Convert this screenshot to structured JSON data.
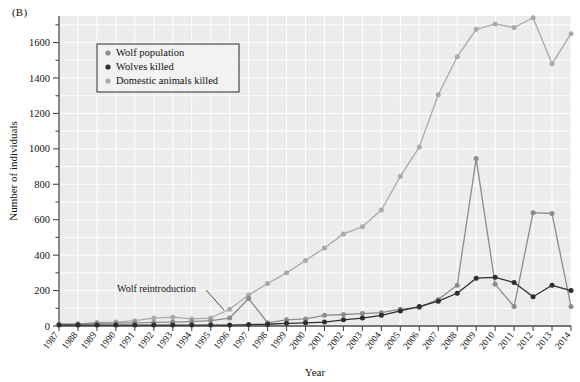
{
  "figure": {
    "panel_label": "(B)",
    "xlabel": "Year",
    "ylabel": "Number of individuals"
  },
  "annotation": {
    "text": "Wolf reintroduction",
    "anchor_year": "1996"
  },
  "legend": {
    "entries": [
      {
        "label": "Wolf population",
        "color": "#8c8c8c",
        "marker": "circle"
      },
      {
        "label": "Wolves killed",
        "color": "#2e2e2e",
        "marker": "circle"
      },
      {
        "label": "Domestic animals killed",
        "color": "#aaaaaa",
        "marker": "circle"
      }
    ]
  },
  "chart_data": {
    "type": "line",
    "title": "",
    "xlabel": "Year",
    "ylabel": "Number of individuals",
    "xlim": [
      1987,
      2014
    ],
    "ylim": [
      0,
      1750
    ],
    "ytick_step": 200,
    "yminor_step": 100,
    "grid": true,
    "legend_position": "top-left-inside",
    "background": "#ececed",
    "ytick_labels": [
      "0",
      "200",
      "400",
      "600",
      "800",
      "1000",
      "1200",
      "1400",
      "1600"
    ],
    "ytick_values": [
      0,
      200,
      400,
      600,
      800,
      1000,
      1200,
      1400,
      1600
    ],
    "categories": [
      "1987",
      "1988",
      "1989",
      "1990",
      "1991",
      "1992",
      "1993",
      "1994",
      "1995",
      "1996",
      "1997",
      "1998",
      "1999",
      "2000",
      "2001",
      "2002",
      "2003",
      "2004",
      "2005",
      "2006",
      "2007",
      "2008",
      "2009",
      "2010",
      "2011",
      "2012",
      "2013",
      "2014"
    ],
    "series": [
      {
        "name": "Wolf population",
        "color": "#8c8c8c",
        "values": [
          10,
          12,
          14,
          16,
          18,
          20,
          22,
          25,
          30,
          45,
          155,
          18,
          35,
          40,
          60,
          65,
          70,
          75,
          95,
          105,
          150,
          230,
          945,
          235,
          110,
          640,
          635,
          110
        ]
      },
      {
        "name": "Wolves killed",
        "color": "#2e2e2e",
        "values": [
          5,
          5,
          5,
          5,
          5,
          5,
          5,
          5,
          5,
          5,
          8,
          10,
          15,
          18,
          22,
          35,
          45,
          60,
          85,
          110,
          140,
          185,
          270,
          275,
          245,
          165,
          230,
          200
        ]
      },
      {
        "name": "Domestic animals killed",
        "color": "#aaaaaa",
        "values": [
          8,
          10,
          20,
          22,
          30,
          45,
          50,
          40,
          45,
          95,
          175,
          240,
          300,
          370,
          440,
          520,
          560,
          655,
          845,
          1010,
          1305,
          1520,
          1675,
          1705,
          1685,
          1740,
          1480,
          1650
        ]
      }
    ]
  }
}
